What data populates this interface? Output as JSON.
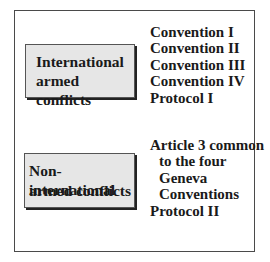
{
  "diagram": {
    "categories": [
      {
        "label_lines": [
          "International",
          "armed conflicts"
        ],
        "instruments": [
          {
            "text": "Convention I",
            "indent": false
          },
          {
            "text": "Convention II",
            "indent": false
          },
          {
            "text": "Convention III",
            "indent": false
          },
          {
            "text": "Convention IV",
            "indent": false
          },
          {
            "text": "Protocol I",
            "indent": false
          }
        ]
      },
      {
        "label_lines": [
          "Non-international",
          "armed conflicts"
        ],
        "instruments": [
          {
            "text": "Article 3 common",
            "indent": false
          },
          {
            "text": "to the four",
            "indent": true
          },
          {
            "text": "Geneva",
            "indent": true
          },
          {
            "text": "Conventions",
            "indent": true
          },
          {
            "text": "Protocol II",
            "indent": false
          }
        ]
      }
    ],
    "colors": {
      "box_fill": "#e6e6e6",
      "border": "#4a4a4a",
      "shadow": "#222222",
      "text": "#1a1a1a"
    }
  }
}
